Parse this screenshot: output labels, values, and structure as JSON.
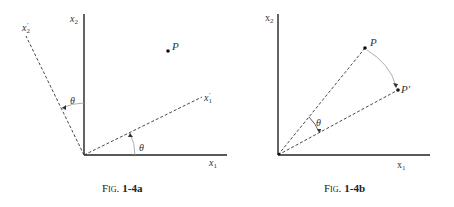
{
  "figures": [
    {
      "id": "fig-1-4a",
      "caption_prefix": "Fig.",
      "caption_number": "1-4a",
      "axes": {
        "x1": "x",
        "x1_sub": "1",
        "x2": "x",
        "x2_sub": "2"
      },
      "rotated_axes": {
        "x1p": "x",
        "x1p_sub": "1",
        "x1p_prime": "′",
        "x2p": "x",
        "x2p_sub": "2",
        "x2p_prime": "′"
      },
      "point_label": "P",
      "angle_label_1": "θ",
      "angle_label_2": "θ"
    },
    {
      "id": "fig-1-4b",
      "caption_prefix": "Fig.",
      "caption_number": "1-4b",
      "axes": {
        "x1": "x",
        "x1_sub": "1",
        "x2": "x",
        "x2_sub": "2"
      },
      "point_label": "P",
      "rotated_point_label": "P′",
      "angle_label": "θ"
    }
  ],
  "colors": {
    "line": "#222222",
    "arc": "#9a9a9a",
    "text": "#333333"
  }
}
